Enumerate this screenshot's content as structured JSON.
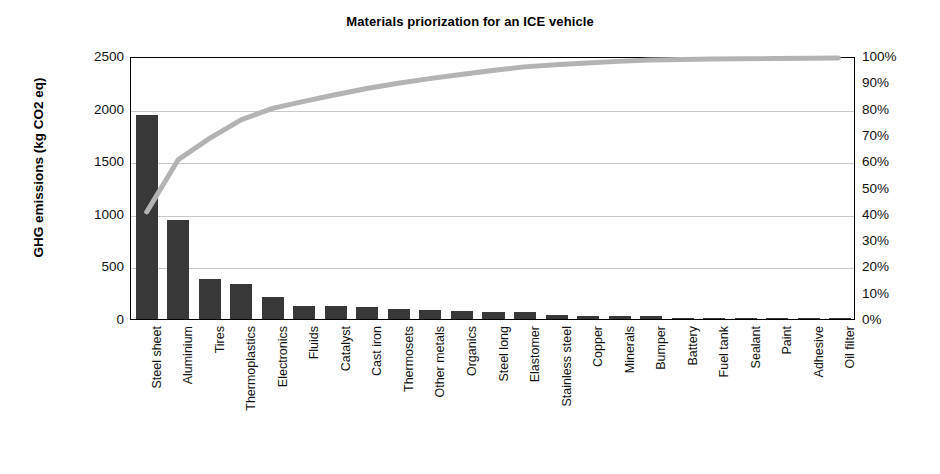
{
  "chart_data": {
    "type": "bar",
    "title": "Materials priorization for an ICE vehicle",
    "xlabel": "",
    "ylabel": "GHG emissions (kg CO2 eq)",
    "y2label": "",
    "ylim": [
      0,
      2500
    ],
    "y2lim": [
      0,
      100
    ],
    "grid": true,
    "legend": "none",
    "yticks": [
      "2500",
      "2000",
      "1500",
      "1000",
      "500",
      "0"
    ],
    "ytick_values": [
      2500,
      2000,
      1500,
      1000,
      500,
      0
    ],
    "y2ticks": [
      "100%",
      "90%",
      "80%",
      "70%",
      "60%",
      "50%",
      "40%",
      "30%",
      "20%",
      "10%",
      "0%"
    ],
    "y2tick_values": [
      100,
      90,
      80,
      70,
      60,
      50,
      40,
      30,
      20,
      10,
      0
    ],
    "categories": [
      "Steel sheet",
      "Aluminium",
      "Tires",
      "Thermoplastics",
      "Electronics",
      "Fluids",
      "Catalyst",
      "Cast iron",
      "Thermosets",
      "Other metals",
      "Organics",
      "Steel long",
      "Elastomer",
      "Stainless steel",
      "Copper",
      "Minerals",
      "Bumper",
      "Battery",
      "Fuel tank",
      "Sealant",
      "Paint",
      "Adhesive",
      "Oil filter"
    ],
    "series": [
      {
        "name": "GHG emissions (kg CO2 eq)",
        "type": "bar",
        "color": "#383838",
        "values": [
          1940,
          945,
          385,
          335,
          210,
          125,
          120,
          115,
          95,
          85,
          75,
          70,
          65,
          40,
          30,
          28,
          25,
          10,
          8,
          6,
          5,
          4,
          3
        ]
      },
      {
        "name": "Cumulative percentage",
        "type": "line",
        "color": "#b3b3b3",
        "values": [
          41.0,
          61.0,
          69.2,
          76.3,
          80.7,
          83.4,
          85.9,
          88.3,
          90.3,
          92.1,
          93.7,
          95.2,
          96.6,
          97.4,
          98.1,
          98.7,
          99.2,
          99.4,
          99.6,
          99.7,
          99.8,
          99.9,
          100.0
        ]
      }
    ]
  },
  "chart": {
    "title": "Materials priorization for an ICE vehicle",
    "y_axis_title": "GHG emissions (kg CO2 eq)"
  }
}
